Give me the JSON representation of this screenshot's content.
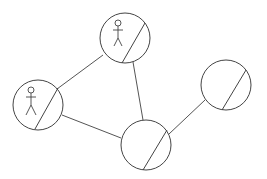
{
  "diagram": {
    "type": "network-graph",
    "stroke_color": "#444444",
    "background": "#ffffff",
    "nodes": [
      {
        "id": "top",
        "cx": 125,
        "cy": 38,
        "r": 25,
        "has_actor": true
      },
      {
        "id": "left",
        "cx": 38,
        "cy": 105,
        "r": 25,
        "has_actor": true
      },
      {
        "id": "bottom",
        "cx": 146,
        "cy": 145,
        "r": 25,
        "has_actor": false
      },
      {
        "id": "right",
        "cx": 226,
        "cy": 85,
        "r": 25,
        "has_actor": false
      }
    ],
    "edges": [
      {
        "from": "left",
        "to": "top"
      },
      {
        "from": "top",
        "to": "bottom"
      },
      {
        "from": "left",
        "to": "bottom"
      },
      {
        "from": "bottom",
        "to": "right"
      }
    ]
  }
}
